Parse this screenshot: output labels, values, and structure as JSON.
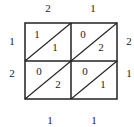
{
  "diagram": {
    "type": "lattice-multiplication",
    "top_digits": [
      "2",
      "1"
    ],
    "right_digits": [
      "2",
      "1"
    ],
    "left_digits": [
      "1",
      "2"
    ],
    "bottom_digits": [
      "1",
      "1"
    ],
    "cells": [
      [
        {
          "tens": "1",
          "ones": "1"
        },
        {
          "tens": "0",
          "ones": "2"
        }
      ],
      [
        {
          "tens": "0",
          "ones": "2"
        },
        {
          "tens": "0",
          "ones": "1"
        }
      ]
    ],
    "line_color": "#222222"
  }
}
